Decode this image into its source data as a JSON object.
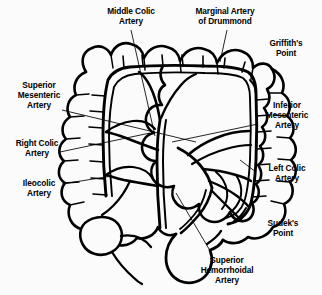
{
  "figure": {
    "type": "anatomical-line-diagram",
    "background_color": "#fbfbfb",
    "ink_color": "#000000",
    "width": 322,
    "height": 295
  },
  "labels": [
    {
      "id": "middle-colic-artery",
      "text": "Middle Colic\nArtery",
      "x": 92,
      "y": 6,
      "w": 78,
      "align": "center"
    },
    {
      "id": "marginal-artery-of-drummond",
      "text": "Marginal Artery\nof Drummond",
      "x": 183,
      "y": 6,
      "w": 84,
      "align": "center"
    },
    {
      "id": "griffiths-point",
      "text": "Griffith's\nPoint",
      "x": 256,
      "y": 38,
      "w": 60,
      "align": "center"
    },
    {
      "id": "superior-mesenteric-artery",
      "text": "Superior\nMesenteric\nArtery",
      "x": 8,
      "y": 80,
      "w": 62,
      "align": "center"
    },
    {
      "id": "inferior-mesenteric-artery",
      "text": "Inferior\nMesenteric\nArtery",
      "x": 256,
      "y": 100,
      "w": 62,
      "align": "center"
    },
    {
      "id": "right-colic-artery",
      "text": "Right Colic\nArtery",
      "x": 6,
      "y": 138,
      "w": 62,
      "align": "center"
    },
    {
      "id": "left-colic-artery",
      "text": "Left Colic\nArtery",
      "x": 258,
      "y": 163,
      "w": 58,
      "align": "center"
    },
    {
      "id": "ileocolic-artery",
      "text": "Ileocolic\nArtery",
      "x": 10,
      "y": 178,
      "w": 58,
      "align": "center"
    },
    {
      "id": "sudeks-point",
      "text": "Sudek's\nPoint",
      "x": 254,
      "y": 218,
      "w": 58,
      "align": "center"
    },
    {
      "id": "superior-hemorrhoidal-artery",
      "text": "Superior\nHemorrhoidal\nArtery",
      "x": 188,
      "y": 255,
      "w": 78,
      "align": "center"
    }
  ],
  "leader_lines": [
    {
      "id": "leader-middle-colic",
      "from": [
        131,
        30
      ],
      "to": [
        155,
        136
      ]
    },
    {
      "id": "leader-marginal-drummond",
      "from": [
        227,
        30
      ],
      "to": [
        220,
        62
      ]
    },
    {
      "id": "leader-superior-mesenteric",
      "from": [
        62,
        110
      ],
      "to": [
        196,
        142
      ]
    },
    {
      "id": "leader-right-colic",
      "from": [
        60,
        152
      ],
      "to": [
        150,
        133
      ]
    },
    {
      "id": "leader-ileocolic",
      "from": [
        62,
        184
      ],
      "to": [
        112,
        176
      ]
    },
    {
      "id": "leader-inferior-mesenteric",
      "from": [
        258,
        124
      ],
      "to": [
        172,
        142
      ]
    },
    {
      "id": "leader-left-colic",
      "from": [
        256,
        172
      ],
      "to": [
        240,
        160
      ]
    },
    {
      "id": "leader-superior-hemorrhoidal",
      "from": [
        212,
        254
      ],
      "to": [
        176,
        193
      ]
    }
  ],
  "anatomy": {
    "structures": [
      "ascending colon",
      "hepatic flexure",
      "transverse colon",
      "splenic flexure",
      "descending colon",
      "sigmoid colon",
      "rectum",
      "cecum",
      "appendix",
      "terminal ileum"
    ],
    "arteries": [
      "superior mesenteric artery",
      "middle colic artery",
      "right colic artery",
      "ileocolic artery",
      "marginal artery of Drummond",
      "inferior mesenteric artery",
      "left colic artery",
      "sigmoid arteries",
      "superior hemorrhoidal artery"
    ],
    "watershed_points": [
      "Griffith's Point",
      "Sudek's Point"
    ]
  }
}
